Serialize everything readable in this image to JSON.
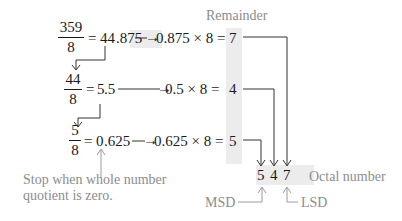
{
  "header": {
    "remainder_label": "Remainder"
  },
  "steps": [
    {
      "numerator": "359",
      "denominator": "8",
      "equals": "=",
      "whole": "44",
      "fraction": ".875",
      "multiply": "0.875 × 8 =",
      "remainder": "7"
    },
    {
      "numerator": "44",
      "denominator": "8",
      "equals": "=",
      "whole": "5",
      "fraction": ".5",
      "multiply": "0.5 × 8 =",
      "remainder": "4"
    },
    {
      "numerator": "5",
      "denominator": "8",
      "equals": "=",
      "whole": "0",
      "fraction": ".625",
      "multiply": "0.625 × 8 =",
      "remainder": "5"
    }
  ],
  "arrow_glyph": "→",
  "result": {
    "digits": [
      "5",
      "4",
      "7"
    ],
    "label": "Octal number",
    "msd_label": "MSD",
    "lsd_label": "LSD"
  },
  "note": {
    "line1": "Stop when whole number",
    "line2": "quotient is zero."
  },
  "colors": {
    "text": "#1a1a1a",
    "annotation": "#8c8c8c",
    "shade": "#ececec"
  }
}
